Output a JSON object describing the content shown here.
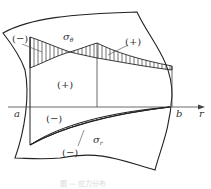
{
  "diagram": {
    "type": "stress-distribution",
    "labels": {
      "sigma_theta": "σ",
      "sigma_theta_sub": "θ",
      "sigma_r": "σ",
      "sigma_r_sub": "r",
      "neg_top_left": "(−)",
      "pos_top_right": "(+)",
      "pos_middle_left": "(+)",
      "neg_middle": "(−)",
      "neg_bottom": "(−)",
      "axis_a": "a",
      "axis_b": "b",
      "axis_r": "r"
    },
    "caption": "图 — 应力分布",
    "colors": {
      "line": "#222222",
      "hatch": "#333333",
      "background": "#ffffff"
    }
  }
}
